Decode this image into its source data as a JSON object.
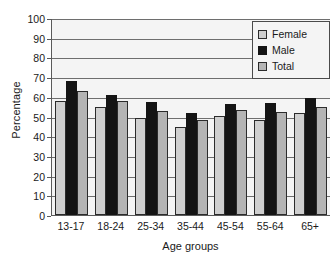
{
  "chart_data": {
    "type": "bar",
    "title": "",
    "xlabel": "Age groups",
    "ylabel": "Percentage",
    "ylim": [
      0,
      100
    ],
    "ytick_step": 10,
    "yticks": [
      100,
      90,
      80,
      70,
      60,
      50,
      40,
      30,
      20,
      10,
      0
    ],
    "grid": true,
    "legend_position": "top-right",
    "categories": [
      "13-17",
      "18-24",
      "25-34",
      "35-44",
      "45-54",
      "55-64",
      "65+"
    ],
    "series": [
      {
        "name": "Female",
        "color": "#cfcfcf",
        "values": [
          58,
          55,
          49,
          44.5,
          50.5,
          48,
          52
        ]
      },
      {
        "name": "Male",
        "color": "#141414",
        "values": [
          68,
          61,
          57.5,
          52,
          56.5,
          57,
          59.5
        ]
      },
      {
        "name": "Total",
        "color": "#b4b4b4",
        "values": [
          63,
          58,
          53,
          48,
          53.5,
          52.5,
          55
        ]
      }
    ]
  },
  "legend": {
    "items": [
      {
        "label": "Female",
        "swatch": "legend-swatch-female"
      },
      {
        "label": "Male",
        "swatch": "legend-swatch-male"
      },
      {
        "label": "Total",
        "swatch": "legend-swatch-total"
      }
    ]
  }
}
